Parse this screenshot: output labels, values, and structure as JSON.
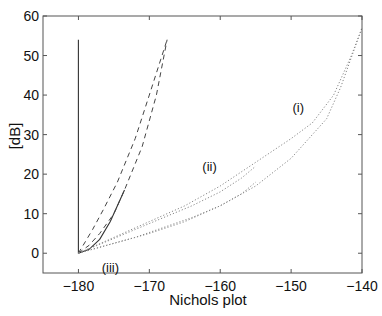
{
  "chart_data": {
    "type": "line",
    "title": "",
    "xlabel": "Nichols plot",
    "ylabel": "[dB]",
    "xlim": [
      -185,
      -140
    ],
    "ylim": [
      -5,
      60
    ],
    "xticks": [
      -180,
      -170,
      -160,
      -150,
      -140
    ],
    "yticks": [
      0,
      10,
      20,
      30,
      40,
      50,
      60
    ],
    "xtick_labels": [
      "−180",
      "−170",
      "−160",
      "−150",
      "−140"
    ],
    "ytick_labels": [
      "0",
      "10",
      "20",
      "30",
      "40",
      "50",
      "60"
    ],
    "grid": false,
    "legend": null,
    "annotations": [
      {
        "text": "(i)",
        "x": -149,
        "y": 37
      },
      {
        "text": "(ii)",
        "x": -161.5,
        "y": 22
      },
      {
        "text": "(iii)",
        "x": -175.5,
        "y": -3.5
      }
    ],
    "series": [
      {
        "name": "vertical solid",
        "style": "solid",
        "x": [
          -180,
          -180
        ],
        "y": [
          0,
          54
        ]
      },
      {
        "name": "solid curve",
        "style": "solid",
        "x": [
          -180,
          -178.5,
          -177,
          -175.5,
          -174.5,
          -173.5
        ],
        "y": [
          0,
          1,
          3.5,
          8,
          12,
          16
        ]
      },
      {
        "name": "dashed (iii) curve 1",
        "style": "dashed",
        "x": [
          -180,
          -179,
          -178,
          -176.5,
          -174.5,
          -172,
          -170,
          -167.5
        ],
        "y": [
          0,
          3,
          6,
          11,
          18,
          29,
          40,
          54
        ]
      },
      {
        "name": "dashed (iii) curve 2",
        "style": "dashed",
        "x": [
          -180,
          -178.5,
          -177,
          -175,
          -173.5,
          -171,
          -169,
          -167.5
        ],
        "y": [
          0,
          2,
          5,
          10,
          16,
          27,
          40,
          54
        ]
      },
      {
        "name": "dotted (i) upper",
        "style": "dotted",
        "x": [
          -180,
          -175,
          -170,
          -165,
          -160,
          -155,
          -150,
          -147,
          -144,
          -141.5,
          -140
        ],
        "y": [
          0,
          4,
          8,
          12,
          17,
          23,
          29,
          33,
          40,
          50,
          57
        ]
      },
      {
        "name": "dotted (i) lower",
        "style": "dotted",
        "x": [
          -180,
          -175,
          -170,
          -165,
          -160,
          -155,
          -150,
          -145,
          -143,
          -141,
          -140
        ],
        "y": [
          0,
          2.5,
          5,
          8,
          12,
          17,
          24,
          34,
          42,
          52,
          57
        ]
      },
      {
        "name": "dotted (ii) upper",
        "style": "dotted",
        "x": [
          -180,
          -176,
          -172,
          -168,
          -164,
          -160,
          -157,
          -155
        ],
        "y": [
          0,
          3,
          6,
          9,
          12,
          15.5,
          19,
          22
        ]
      },
      {
        "name": "dotted (ii) lower",
        "style": "dotted",
        "x": [
          -180,
          -176,
          -172,
          -168,
          -164,
          -160,
          -157,
          -155
        ],
        "y": [
          0,
          2,
          4,
          6.5,
          9,
          12,
          15,
          18
        ]
      }
    ]
  }
}
